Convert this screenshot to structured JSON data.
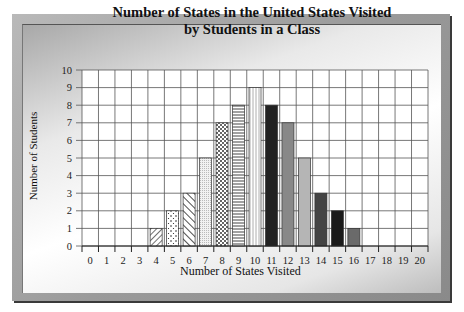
{
  "chart_data": {
    "type": "bar",
    "title": "Number of States in the United States Visited by Students in a Class",
    "title_lines": [
      "Number of States in the United States Visited",
      "by Students in a Class"
    ],
    "xlabel": "Number of States Visited",
    "ylabel": "Number of Students",
    "categories": [
      "0",
      "1",
      "2",
      "3",
      "4",
      "5",
      "6",
      "7",
      "8",
      "9",
      "10",
      "11",
      "12",
      "13",
      "14",
      "15",
      "16",
      "17",
      "18",
      "19",
      "20"
    ],
    "values": [
      0,
      0,
      0,
      0,
      1,
      2,
      3,
      5,
      7,
      8,
      9,
      8,
      7,
      5,
      3,
      2,
      1,
      0,
      0,
      0,
      0
    ],
    "ylim": [
      0,
      10
    ],
    "yticks": [
      0,
      1,
      2,
      3,
      4,
      5,
      6,
      7,
      8,
      9,
      10
    ],
    "grid": true,
    "legend": null
  }
}
